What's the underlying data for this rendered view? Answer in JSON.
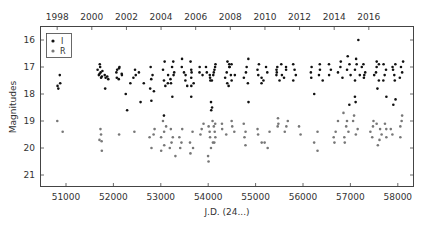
{
  "chart_data": {
    "type": "scatter",
    "title": "",
    "xlabel": "J.D. (24...)",
    "ylabel": "Magnitudes",
    "x_top_label": "",
    "xlim": [
      50450,
      58350
    ],
    "ylim": [
      21.45,
      15.5
    ],
    "y_inverted": true,
    "grid": false,
    "legend_position": "upper-left",
    "x_ticks": [
      51000,
      52000,
      53000,
      54000,
      55000,
      56000,
      57000,
      58000
    ],
    "x_tick_labels": [
      "51000",
      "52000",
      "53000",
      "54000",
      "55000",
      "56000",
      "57000",
      "58000"
    ],
    "top_ticks": [
      1998,
      2000,
      2002,
      2004,
      2006,
      2008,
      2010,
      2012,
      2014,
      2016
    ],
    "top_tick_labels": [
      "1998",
      "2000",
      "2002",
      "2004",
      "2006",
      "2008",
      "2010",
      "2012",
      "2014",
      "2016"
    ],
    "y_ticks": [
      16,
      17,
      18,
      19,
      20,
      21
    ],
    "y_tick_labels": [
      "16",
      "17",
      "18",
      "19",
      "20",
      "21"
    ],
    "series": [
      {
        "name": "I",
        "color": "#111111",
        "clusters": [
          {
            "jd": 50870,
            "mags": [
              17.3,
              17.6,
              17.7,
              17.8
            ]
          },
          {
            "jd": 51720,
            "mags": [
              16.9,
              17.0,
              17.1,
              17.15,
              17.2,
              17.25,
              17.3,
              17.35,
              17.4
            ]
          },
          {
            "jd": 51870,
            "mags": [
              17.3,
              17.35,
              17.4,
              17.45,
              17.8
            ]
          },
          {
            "jd": 52120,
            "mags": [
              17.0,
              17.05,
              17.1,
              17.2,
              17.25,
              17.3,
              17.4,
              17.45
            ]
          },
          {
            "jd": 52300,
            "mags": [
              17.6,
              18.0,
              18.6
            ]
          },
          {
            "jd": 52450,
            "mags": [
              17.1,
              17.3,
              17.4
            ]
          },
          {
            "jd": 52580,
            "mags": [
              17.2,
              17.6,
              18.3
            ]
          },
          {
            "jd": 52820,
            "mags": [
              17.0,
              17.3,
              17.45,
              17.8,
              17.9,
              18.25
            ]
          },
          {
            "jd": 53100,
            "mags": [
              16.8,
              17.1,
              17.3,
              17.5,
              17.6,
              17.7,
              18.8
            ]
          },
          {
            "jd": 53250,
            "mags": [
              16.8,
              17.0,
              17.2,
              17.3,
              17.45,
              17.6,
              18.1
            ]
          },
          {
            "jd": 53500,
            "mags": [
              16.7,
              17.0,
              17.2,
              17.3,
              17.5,
              17.7
            ]
          },
          {
            "jd": 53650,
            "mags": [
              16.8,
              17.1,
              17.2,
              17.4,
              17.6,
              17.7,
              18.1
            ]
          },
          {
            "jd": 53850,
            "mags": [
              17.0,
              17.2,
              17.3
            ]
          },
          {
            "jd": 54000,
            "mags": [
              17.0,
              17.2,
              17.3,
              17.5,
              18.3
            ]
          },
          {
            "jd": 54100,
            "mags": [
              16.9,
              17.0,
              17.1,
              17.2,
              17.3,
              17.4,
              17.5,
              18.5,
              18.6
            ]
          },
          {
            "jd": 54420,
            "mags": [
              16.8,
              16.9,
              17.0,
              17.2,
              17.3,
              17.4,
              17.6,
              17.7
            ]
          },
          {
            "jd": 54500,
            "mags": [
              16.9,
              17.0,
              17.3,
              17.5
            ]
          },
          {
            "jd": 54800,
            "mags": [
              16.7,
              17.0,
              17.2,
              17.4,
              17.6,
              18.3
            ]
          },
          {
            "jd": 55100,
            "mags": [
              16.9,
              17.1,
              17.3,
              17.4,
              17.6
            ]
          },
          {
            "jd": 55200,
            "mags": [
              17.0,
              17.2,
              17.5
            ]
          },
          {
            "jd": 55500,
            "mags": [
              16.9,
              17.0,
              17.1,
              17.2,
              17.3,
              17.5
            ]
          },
          {
            "jd": 55600,
            "mags": [
              17.0,
              17.1,
              17.3,
              17.4
            ]
          },
          {
            "jd": 55850,
            "mags": [
              16.9,
              17.1,
              17.3,
              17.5
            ]
          },
          {
            "jd": 56200,
            "mags": [
              17.0,
              17.2,
              17.4,
              18.0
            ]
          },
          {
            "jd": 56400,
            "mags": [
              16.9,
              17.1,
              17.3,
              17.5
            ]
          },
          {
            "jd": 56600,
            "mags": [
              16.9,
              17.1,
              17.3
            ]
          },
          {
            "jd": 56800,
            "mags": [
              16.8,
              17.0,
              17.2,
              17.4
            ]
          },
          {
            "jd": 56950,
            "mags": [
              16.6,
              16.9,
              17.1,
              17.3,
              18.4
            ]
          },
          {
            "jd": 57150,
            "mags": [
              16.0,
              16.7,
              16.9,
              17.1,
              17.3,
              17.5,
              18.1,
              18.3
            ]
          },
          {
            "jd": 57300,
            "mags": [
              16.9,
              17.0,
              17.2,
              17.3,
              17.4
            ]
          },
          {
            "jd": 57550,
            "mags": [
              16.8,
              16.9,
              17.0,
              17.2,
              17.3,
              17.5,
              17.8
            ]
          },
          {
            "jd": 57700,
            "mags": [
              16.9,
              17.1,
              17.3,
              17.5,
              18.1
            ]
          },
          {
            "jd": 57900,
            "mags": [
              16.9,
              17.0,
              17.1,
              17.3,
              17.5,
              18.2,
              18.4
            ]
          },
          {
            "jd": 58050,
            "mags": [
              16.8,
              17.0,
              17.2,
              17.4
            ]
          }
        ]
      },
      {
        "name": "R",
        "color": "#777777",
        "clusters": [
          {
            "jd": 50870,
            "mags": [
              19.0,
              19.4
            ]
          },
          {
            "jd": 51720,
            "mags": [
              19.3,
              19.5,
              19.7,
              19.75,
              20.1
            ]
          },
          {
            "jd": 52120,
            "mags": [
              19.5
            ]
          },
          {
            "jd": 52450,
            "mags": [
              19.4
            ]
          },
          {
            "jd": 52820,
            "mags": [
              19.3,
              19.5,
              19.6,
              20.0
            ]
          },
          {
            "jd": 53050,
            "mags": [
              19.0,
              19.2,
              19.4,
              19.6,
              19.9,
              20.1
            ]
          },
          {
            "jd": 53250,
            "mags": [
              19.3,
              19.6,
              19.8,
              20.0,
              20.3
            ]
          },
          {
            "jd": 53450,
            "mags": [
              19.3,
              19.6,
              19.8,
              20.0
            ]
          },
          {
            "jd": 53650,
            "mags": [
              19.4,
              19.8,
              20.0,
              20.2
            ]
          },
          {
            "jd": 53850,
            "mags": [
              19.1,
              19.3,
              19.5
            ]
          },
          {
            "jd": 54050,
            "mags": [
              19.0,
              19.2,
              19.4,
              19.6,
              19.8,
              20.0,
              20.3,
              20.5
            ]
          },
          {
            "jd": 54150,
            "mags": [
              19.1,
              19.2,
              19.4,
              19.6,
              19.8
            ]
          },
          {
            "jd": 54350,
            "mags": [
              19.1,
              19.3,
              19.5
            ]
          },
          {
            "jd": 54500,
            "mags": [
              19.0,
              19.2,
              19.4
            ]
          },
          {
            "jd": 54800,
            "mags": [
              19.1,
              19.4,
              19.6,
              19.9
            ]
          },
          {
            "jd": 55100,
            "mags": [
              19.3,
              19.5,
              19.8
            ]
          },
          {
            "jd": 55250,
            "mags": [
              19.4,
              19.8,
              20.0
            ]
          },
          {
            "jd": 55500,
            "mags": [
              18.9,
              19.1,
              19.2
            ]
          },
          {
            "jd": 55650,
            "mags": [
              19.0,
              19.2,
              19.4
            ]
          },
          {
            "jd": 55900,
            "mags": [
              19.2,
              19.5
            ]
          },
          {
            "jd": 56250,
            "mags": [
              19.4,
              19.8,
              20.1
            ]
          },
          {
            "jd": 56700,
            "mags": [
              19.0,
              19.4,
              19.6,
              19.8
            ]
          },
          {
            "jd": 56900,
            "mags": [
              18.7,
              19.0,
              19.2,
              19.4,
              19.6,
              19.8
            ]
          },
          {
            "jd": 57100,
            "mags": [
              18.8,
              19.0,
              19.3,
              19.5
            ]
          },
          {
            "jd": 57450,
            "mags": [
              19.0,
              19.2,
              19.4,
              19.6
            ]
          },
          {
            "jd": 57600,
            "mags": [
              19.1,
              19.3,
              19.5,
              19.7,
              19.9
            ]
          },
          {
            "jd": 57750,
            "mags": [
              19.1,
              19.3,
              19.6
            ]
          },
          {
            "jd": 57900,
            "mags": [
              19.3,
              19.5
            ]
          },
          {
            "jd": 58050,
            "mags": [
              18.8,
              19.0,
              19.2,
              19.6
            ]
          }
        ]
      }
    ]
  },
  "legend": {
    "items": [
      {
        "label": "I",
        "color": "#111111"
      },
      {
        "label": "R",
        "color": "#777777"
      }
    ]
  },
  "axes": {
    "xlabel": "J.D. (24...)",
    "ylabel": "Magnitudes"
  }
}
